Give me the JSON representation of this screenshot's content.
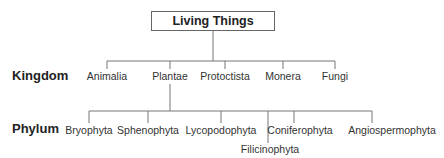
{
  "diagram": {
    "root": {
      "label": "Living Things"
    },
    "ranks": [
      {
        "label": "Kingdom"
      },
      {
        "label": "Phylum"
      }
    ],
    "kingdoms": [
      {
        "label": "Animalia",
        "x": 107
      },
      {
        "label": "Plantae",
        "x": 170
      },
      {
        "label": "Protoctista",
        "x": 225
      },
      {
        "label": "Monera",
        "x": 283
      },
      {
        "label": "Fungi",
        "x": 335
      }
    ],
    "phyla": [
      {
        "label": "Bryophyta",
        "x": 89
      },
      {
        "label": "Sphenophyta",
        "x": 148
      },
      {
        "label": "Lycopodophyta",
        "x": 221
      },
      {
        "label": "Filicinophyta",
        "x": 270
      },
      {
        "label": "Coniferophyta",
        "x": 294
      },
      {
        "label": "Angiospermophyta",
        "x": 372
      }
    ],
    "line_color": "#777777",
    "box_border_color": "#666666"
  }
}
